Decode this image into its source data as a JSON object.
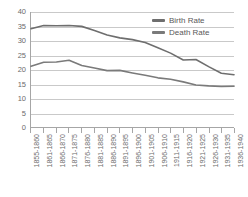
{
  "chart_data": {
    "type": "line",
    "title": "",
    "xlabel": "",
    "ylabel": "",
    "ylim": [
      0,
      40
    ],
    "ytick_step": 5,
    "yticks": [
      40,
      35,
      30,
      25,
      20,
      15,
      10,
      5,
      0
    ],
    "grid": true,
    "legend_position": "top-right",
    "categories": [
      "1855-1860",
      "1861-1865",
      "1866-1870",
      "1871-1875",
      "1876-1880",
      "1881-1885",
      "1886-1890",
      "1891-1895",
      "1896-1900",
      "1901-1905",
      "1906-1910",
      "1911-1915",
      "1916-1920",
      "1921-1925",
      "1926-1930",
      "1931-1935",
      "1936-1940"
    ],
    "series": [
      {
        "name": "Birth Rate",
        "color": "#6e6e6e",
        "values": [
          34.2,
          35.3,
          35.2,
          35.3,
          35.0,
          33.6,
          32.0,
          31.0,
          30.4,
          29.4,
          27.6,
          25.7,
          23.3,
          23.5,
          21.0,
          18.7,
          18.2
        ]
      },
      {
        "name": "Death Rate",
        "color": "#7a7a7a",
        "values": [
          21.1,
          22.5,
          22.6,
          23.2,
          21.4,
          20.5,
          19.6,
          19.7,
          18.8,
          18.0,
          17.1,
          16.6,
          15.7,
          14.6,
          14.3,
          14.1,
          14.2
        ]
      }
    ]
  },
  "legend": {
    "items": [
      {
        "label": "Birth Rate"
      },
      {
        "label": "Death Rate"
      }
    ]
  },
  "axis_color": "#a6a6a6",
  "grid_color": "#c9c9c9",
  "background": "#ffffff"
}
